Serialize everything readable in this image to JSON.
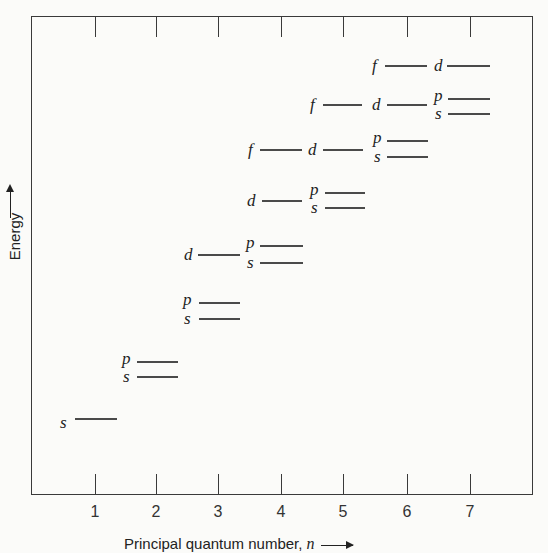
{
  "chart_data": {
    "type": "energy-level-diagram",
    "title": "",
    "xlabel": "Principal quantum number, n",
    "ylabel": "Energy",
    "x_ticks": [
      "1",
      "2",
      "3",
      "4",
      "5",
      "6",
      "7"
    ],
    "grid": false,
    "levels": [
      {
        "n": 1,
        "sublevel": "s",
        "y": 419,
        "x1": 75,
        "x2": 117,
        "label_x": 60,
        "label_y": 414
      },
      {
        "n": 2,
        "sublevel": "s",
        "y": 377,
        "x1": 137,
        "x2": 178,
        "label_x": 123,
        "label_y": 368
      },
      {
        "n": 2,
        "sublevel": "p",
        "y": 362,
        "x1": 137,
        "x2": 178,
        "label_x": 122,
        "label_y": 350
      },
      {
        "n": 3,
        "sublevel": "s",
        "y": 319,
        "x1": 199,
        "x2": 240,
        "label_x": 184,
        "label_y": 310
      },
      {
        "n": 3,
        "sublevel": "p",
        "y": 303,
        "x1": 199,
        "x2": 240,
        "label_x": 183,
        "label_y": 291
      },
      {
        "n": 3,
        "sublevel": "d",
        "y": 255,
        "x1": 198,
        "x2": 240,
        "label_x": 184,
        "label_y": 246
      },
      {
        "n": 4,
        "sublevel": "s",
        "y": 263,
        "x1": 260,
        "x2": 303,
        "label_x": 247,
        "label_y": 254
      },
      {
        "n": 4,
        "sublevel": "p",
        "y": 246,
        "x1": 260,
        "x2": 303,
        "label_x": 246,
        "label_y": 234
      },
      {
        "n": 4,
        "sublevel": "d",
        "y": 201,
        "x1": 262,
        "x2": 302,
        "label_x": 247,
        "label_y": 192
      },
      {
        "n": 4,
        "sublevel": "f",
        "y": 150,
        "x1": 260,
        "x2": 302,
        "label_x": 248,
        "label_y": 141
      },
      {
        "n": 5,
        "sublevel": "s",
        "y": 208,
        "x1": 325,
        "x2": 365,
        "label_x": 311,
        "label_y": 199
      },
      {
        "n": 5,
        "sublevel": "p",
        "y": 193,
        "x1": 325,
        "x2": 365,
        "label_x": 310,
        "label_y": 181
      },
      {
        "n": 5,
        "sublevel": "d",
        "y": 150,
        "x1": 323,
        "x2": 363,
        "label_x": 308,
        "label_y": 141
      },
      {
        "n": 5,
        "sublevel": "f",
        "y": 105,
        "x1": 323,
        "x2": 362,
        "label_x": 310,
        "label_y": 96
      },
      {
        "n": 6,
        "sublevel": "s",
        "y": 157,
        "x1": 387,
        "x2": 428,
        "label_x": 374,
        "label_y": 148
      },
      {
        "n": 6,
        "sublevel": "p",
        "y": 141,
        "x1": 387,
        "x2": 428,
        "label_x": 373,
        "label_y": 129
      },
      {
        "n": 6,
        "sublevel": "d",
        "y": 105,
        "x1": 387,
        "x2": 427,
        "label_x": 372,
        "label_y": 96
      },
      {
        "n": 6,
        "sublevel": "f",
        "y": 66,
        "x1": 385,
        "x2": 427,
        "label_x": 372,
        "label_y": 57
      },
      {
        "n": 7,
        "sublevel": "s",
        "y": 114,
        "x1": 448,
        "x2": 490,
        "label_x": 435,
        "label_y": 105
      },
      {
        "n": 7,
        "sublevel": "p",
        "y": 99,
        "x1": 448,
        "x2": 490,
        "label_x": 434,
        "label_y": 87
      },
      {
        "n": 7,
        "sublevel": "d",
        "y": 66,
        "x1": 447,
        "x2": 490,
        "label_x": 434,
        "label_y": 57
      }
    ],
    "x_tick_positions": [
      95,
      156,
      218,
      281,
      343,
      407,
      470
    ]
  },
  "axis": {
    "x_title": "Principal quantum number, ",
    "x_var": "n",
    "y_title": "Energy"
  }
}
